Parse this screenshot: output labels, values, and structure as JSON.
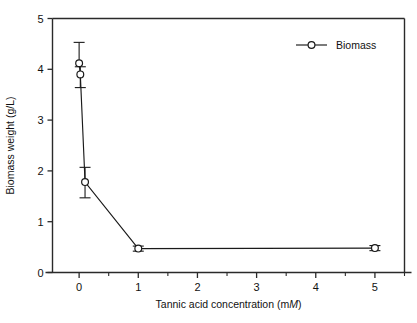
{
  "figure": {
    "background": "#ffffff",
    "axis_color": "#2a2a2a",
    "series_color": "#1a1a1a",
    "marker": "open-circle"
  },
  "axes": {
    "y_title": "Biomass weight (g/L)",
    "x_title_prefix": "Tannic acid concentration (m",
    "x_title_italic": "M",
    "x_title_suffix": ")",
    "x_ticks": [
      "0",
      "1",
      "2",
      "3",
      "4",
      "5"
    ],
    "y_ticks": [
      "0",
      "1",
      "2",
      "3",
      "4",
      "5"
    ]
  },
  "legend": {
    "position": "top-right",
    "entries": [
      {
        "label": "Biomass",
        "marker": "open-circle"
      }
    ]
  },
  "chart_data": {
    "type": "line",
    "title": "",
    "xlabel": "Tannic acid concentration (mM)",
    "ylabel": "Biomass weight (g/L)",
    "xlim": [
      -0.45,
      5.5
    ],
    "ylim": [
      0,
      5
    ],
    "xticks": [
      0,
      1,
      2,
      3,
      4,
      5
    ],
    "yticks": [
      0,
      1,
      2,
      3,
      4,
      5
    ],
    "x_minor_ticks": [
      0.5,
      1.5,
      2.5,
      3.5,
      4.5,
      5.5
    ],
    "grid": false,
    "legend_position": "top right",
    "series": [
      {
        "name": "Biomass",
        "marker": "open-circle",
        "x": [
          0,
          0.02,
          0.1,
          1,
          5
        ],
        "y": [
          4.12,
          3.9,
          1.78,
          0.47,
          0.48
        ],
        "yerr_upper": [
          0.41,
          0.15,
          0.29,
          0.05,
          0.05
        ],
        "yerr_lower": [
          0.0,
          0.26,
          0.31,
          0.05,
          0.05
        ]
      }
    ]
  }
}
